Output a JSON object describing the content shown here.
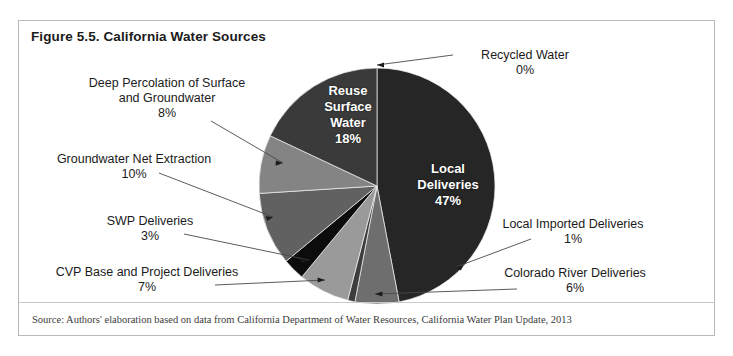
{
  "figure": {
    "title": "Figure 5.5. California Water Sources",
    "source": "Source: Authors' elaboration based on data from California Department of Water Resources, California Water Plan Update, 2013"
  },
  "chart_data": {
    "type": "pie",
    "title": "California Water Sources",
    "xlabel": "",
    "ylabel": "",
    "unit": "percent",
    "legend_position": "none (direct labels with leader lines)",
    "grid": false,
    "categories": [
      "Local Deliveries",
      "Recycled Water",
      "Colorado River Deliveries",
      "Local Imported Deliveries",
      "CVP Base and Project Deliveries",
      "SWP Deliveries",
      "Groundwater Net Extraction",
      "Deep Percolation of Surface and Groundwater",
      "Reuse Surface Water"
    ],
    "values": [
      47,
      0,
      6,
      1,
      7,
      3,
      10,
      8,
      18
    ],
    "slices": [
      {
        "name": "Local Deliveries",
        "value": 47,
        "pct_label": "47%",
        "color": "#262626",
        "label_placement": "inside"
      },
      {
        "name": "Recycled Water",
        "value": 0,
        "pct_label": "0%",
        "color": "#8f8f8f",
        "label_placement": "outside-right"
      },
      {
        "name": "Colorado River Deliveries",
        "value": 6,
        "pct_label": "6%",
        "color": "#6e6e6e",
        "label_placement": "outside-right"
      },
      {
        "name": "Local Imported Deliveries",
        "value": 1,
        "pct_label": "1%",
        "color": "#3d3d3d",
        "label_placement": "outside-right"
      },
      {
        "name": "CVP Base and Project Deliveries",
        "value": 7,
        "pct_label": "7%",
        "color": "#9a9a9a",
        "label_placement": "outside-left"
      },
      {
        "name": "SWP Deliveries",
        "value": 3,
        "pct_label": "3%",
        "color": "#0c0c0c",
        "label_placement": "outside-left"
      },
      {
        "name": "Groundwater Net Extraction",
        "value": 10,
        "pct_label": "10%",
        "color": "#616161",
        "label_placement": "outside-left"
      },
      {
        "name": "Deep Percolation of Surface and Groundwater",
        "value": 8,
        "pct_label": "8%",
        "color": "#848484",
        "label_placement": "outside-left"
      },
      {
        "name": "Reuse Surface Water",
        "value": 18,
        "pct_label": "18%",
        "color": "#3a3a3a",
        "label_placement": "inside"
      }
    ]
  },
  "labels": {
    "local_deliveries": {
      "name": "Local Deliveries",
      "line1": "Local",
      "line2": "Deliveries",
      "pct": "47%"
    },
    "reuse_surface_water": {
      "name": "Reuse Surface Water",
      "line1": "Reuse",
      "line2": "Surface",
      "line3": "Water",
      "pct": "18%"
    },
    "recycled_water": {
      "name": "Recycled Water",
      "line1": "Recycled Water",
      "pct": "0%"
    },
    "local_imported": {
      "name": "Local Imported Deliveries",
      "line1": "Local Imported Deliveries",
      "pct": "1%"
    },
    "colorado_river": {
      "name": "Colorado River Deliveries",
      "line1": "Colorado River Deliveries",
      "pct": "6%"
    },
    "cvp": {
      "name": "CVP Base and Project Deliveries",
      "line1": "CVP Base and Project Deliveries",
      "pct": "7%"
    },
    "swp": {
      "name": "SWP Deliveries",
      "line1": "SWP Deliveries",
      "pct": "3%"
    },
    "groundwater_net": {
      "name": "Groundwater Net Extraction",
      "line1": "Groundwater Net Extraction",
      "pct": "10%"
    },
    "deep_percolation": {
      "name": "Deep Percolation of Surface and Groundwater",
      "line1": "Deep Percolation of Surface",
      "line2": "and Groundwater",
      "pct": "8%"
    }
  }
}
